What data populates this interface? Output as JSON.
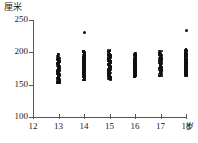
{
  "chart_data": {
    "type": "scatter",
    "title": "",
    "subtitle": "",
    "xlabel": "岁",
    "ylabel": "厘米",
    "xlim": [
      12,
      18
    ],
    "ylim": [
      100,
      250
    ],
    "grid": false,
    "legend": null,
    "x_ticks": [
      12,
      13,
      14,
      15,
      16,
      17,
      18
    ],
    "x_tick_labels": [
      "12",
      "13",
      "14",
      "15",
      "16",
      "17",
      "18"
    ],
    "y_ticks": [
      100,
      150,
      200,
      250
    ],
    "y_tick_labels": [
      "100",
      "150",
      "200",
      "250"
    ],
    "series": [
      {
        "name": "13岁",
        "x": 13,
        "y_min": 152,
        "y_max": 197,
        "values": [
          152,
          153,
          154,
          155,
          156,
          157,
          158,
          159,
          160,
          161,
          162,
          163,
          164,
          165,
          166,
          167,
          168,
          169,
          170,
          171,
          172,
          173,
          174,
          175,
          176,
          177,
          178,
          179,
          180,
          181,
          182,
          183,
          184,
          185,
          186,
          187,
          188,
          189,
          190,
          191,
          192,
          194,
          197
        ]
      },
      {
        "name": "14岁",
        "x": 14,
        "y_min": 157,
        "y_max": 232,
        "values": [
          157,
          158,
          159,
          160,
          161,
          162,
          163,
          164,
          165,
          166,
          167,
          168,
          169,
          170,
          171,
          172,
          173,
          174,
          175,
          176,
          177,
          178,
          179,
          180,
          181,
          182,
          183,
          184,
          185,
          186,
          187,
          188,
          189,
          190,
          191,
          192,
          193,
          194,
          196,
          198,
          200,
          202,
          232
        ]
      },
      {
        "name": "15岁",
        "x": 15,
        "y_min": 158,
        "y_max": 203,
        "values": [
          158,
          159,
          160,
          161,
          162,
          163,
          164,
          165,
          166,
          167,
          168,
          169,
          170,
          171,
          172,
          173,
          174,
          175,
          176,
          177,
          178,
          179,
          180,
          181,
          182,
          183,
          184,
          185,
          186,
          187,
          188,
          189,
          190,
          191,
          192,
          193,
          194,
          195,
          196,
          198,
          200,
          203
        ]
      },
      {
        "name": "16岁",
        "x": 16,
        "y_min": 162,
        "y_max": 198,
        "values": [
          162,
          163,
          164,
          165,
          166,
          167,
          168,
          169,
          170,
          171,
          172,
          173,
          174,
          175,
          176,
          177,
          178,
          179,
          180,
          181,
          182,
          183,
          184,
          185,
          186,
          187,
          188,
          189,
          190,
          191,
          192,
          193,
          194,
          195,
          196,
          198
        ]
      },
      {
        "name": "17岁",
        "x": 17,
        "y_min": 163,
        "y_max": 202,
        "values": [
          163,
          164,
          165,
          166,
          167,
          168,
          169,
          170,
          171,
          172,
          173,
          174,
          175,
          176,
          177,
          178,
          179,
          180,
          181,
          182,
          183,
          184,
          185,
          186,
          187,
          188,
          189,
          190,
          191,
          192,
          193,
          194,
          195,
          196,
          197,
          199,
          202
        ]
      },
      {
        "name": "18岁",
        "x": 18,
        "y_min": 163,
        "y_max": 235,
        "values": [
          163,
          164,
          165,
          166,
          167,
          168,
          169,
          170,
          171,
          172,
          173,
          174,
          175,
          176,
          177,
          178,
          179,
          180,
          181,
          182,
          183,
          184,
          185,
          186,
          187,
          188,
          189,
          190,
          191,
          192,
          193,
          194,
          195,
          196,
          197,
          198,
          200,
          202,
          204,
          235
        ]
      }
    ],
    "annotations": [
      {
        "label": "outlier-14",
        "x": 14,
        "y": 232
      },
      {
        "label": "outlier-18",
        "x": 18,
        "y": 235
      }
    ],
    "colors": {
      "marker": "#111111",
      "axis": "#55555a",
      "text": "#1a1a1a"
    }
  }
}
